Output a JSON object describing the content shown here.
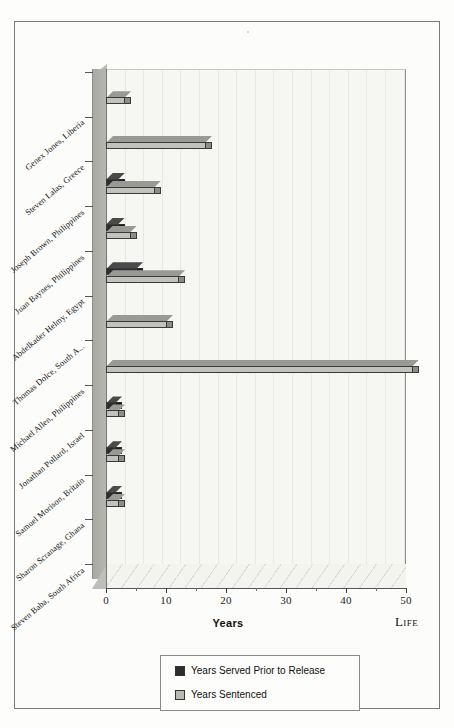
{
  "chart_data": {
    "type": "bar",
    "orientation": "horizontal",
    "title": "",
    "xlabel": "Years",
    "ylabel": "",
    "xlim": [
      0,
      52
    ],
    "xticks": [
      0,
      10,
      20,
      30,
      40,
      50
    ],
    "xticklabels": [
      "0",
      "10",
      "20",
      "30",
      "40",
      "50"
    ],
    "grid": true,
    "annotations": [
      "Life"
    ],
    "legend_position": "bottom-center",
    "categories": [
      "Genex Jones, Liberia",
      "Steven Lalas, Greece",
      "Joseph Brown, Philippines",
      "Juan Baynes, Philippines",
      "Abdelkader Helmy, Egypt",
      "Thomas Dolce, South A...",
      "Michael Allen, Philippines",
      "Jonathan Pollard, Israel",
      "Samuel Morison, Britain",
      "Sharon Scranage, Ghana",
      "Steven Baba, South Africa"
    ],
    "series": [
      {
        "name": "Years Served Prior to Release",
        "color": "#2e2e2e",
        "values": [
          0,
          0,
          2,
          2,
          5,
          0,
          0,
          1.5,
          1.5,
          1.5,
          0
        ]
      },
      {
        "name": "Years Sentenced",
        "color": "#c2c2bd",
        "values": [
          3,
          16.5,
          8,
          4,
          12,
          10,
          51,
          2,
          2,
          2,
          0
        ]
      }
    ]
  },
  "axis": {
    "x_title": "Years",
    "life_label": "Life"
  },
  "legend": {
    "items": [
      {
        "label": "Years Served Prior to Release",
        "swatch": "dark"
      },
      {
        "label": "Years Sentenced",
        "swatch": "light"
      }
    ]
  }
}
